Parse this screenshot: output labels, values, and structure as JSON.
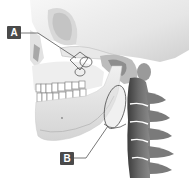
{
  "diagram": {
    "labels": [
      {
        "id": "A",
        "text": "A",
        "points_to": "temporomandibular joint region"
      },
      {
        "id": "B",
        "text": "B",
        "points_to": "neck / cervical soft tissue region behind the jaw"
      }
    ],
    "colors": {
      "label_bg": "#4a4a4a",
      "label_text": "#ffffff",
      "leader_line": "#555555",
      "bone_light": "#f2f2f2",
      "bone_shadow": "#b8b8b8",
      "spine_dark": "#555555"
    }
  }
}
